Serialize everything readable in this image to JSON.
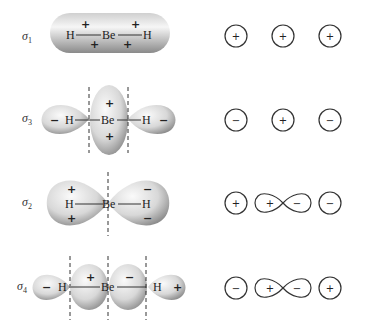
{
  "orbitals": [
    {
      "id": "sigma1",
      "label": "σ",
      "subscript": "1",
      "molecule": {
        "left_atom": "H",
        "center_atom": "Be",
        "right_atom": "H"
      },
      "lobe_signs": [
        "+",
        "+",
        "+",
        "+"
      ],
      "basis_symbols": [
        {
          "type": "s",
          "sign": "+"
        },
        {
          "type": "s",
          "sign": "+"
        },
        {
          "type": "s",
          "sign": "+"
        }
      ]
    },
    {
      "id": "sigma3",
      "label": "σ",
      "subscript": "3",
      "molecule": {
        "left_atom": "H",
        "center_atom": "Be",
        "right_atom": "H"
      },
      "lobe_signs": [
        "−",
        "+",
        "+",
        "−"
      ],
      "basis_symbols": [
        {
          "type": "s",
          "sign": "−"
        },
        {
          "type": "s",
          "sign": "+"
        },
        {
          "type": "s",
          "sign": "−"
        }
      ]
    },
    {
      "id": "sigma2",
      "label": "σ",
      "subscript": "2",
      "molecule": {
        "left_atom": "H",
        "center_atom": "Be",
        "right_atom": "H"
      },
      "lobe_signs": [
        "+",
        "+",
        "−",
        "−"
      ],
      "basis_symbols": [
        {
          "type": "s",
          "sign": "+"
        },
        {
          "type": "p",
          "signs": [
            "+",
            "−"
          ]
        },
        {
          "type": "s",
          "sign": "−"
        }
      ]
    },
    {
      "id": "sigma4",
      "label": "σ",
      "subscript": "4",
      "molecule": {
        "left_atom": "H",
        "center_atom": "Be",
        "right_atom": "H"
      },
      "lobe_signs": [
        "−",
        "+",
        "−",
        "+"
      ],
      "basis_symbols": [
        {
          "type": "s",
          "sign": "−"
        },
        {
          "type": "p",
          "signs": [
            "+",
            "−"
          ]
        },
        {
          "type": "s",
          "sign": "+"
        }
      ]
    }
  ],
  "colors": {
    "lobe_light": "#f4f4f4",
    "lobe_dark": "#9a9a9a",
    "line": "#333333"
  }
}
